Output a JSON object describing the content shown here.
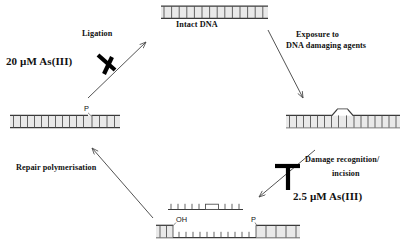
{
  "diagram": {
    "type": "cycle-diagram",
    "background_color": "#ffffff",
    "stroke_color": "#3a3a3a",
    "text_color": "#111111",
    "inhibitor_color": "#000000"
  },
  "nodes": [
    {
      "id": "intact-dna",
      "label": "Intact DNA",
      "position": "top",
      "state": "duplex-intact",
      "description": "continuous double-stranded DNA ladder, no lesion, no nick"
    },
    {
      "id": "damaged-dna",
      "label": "",
      "position": "right",
      "state": "duplex-lesion",
      "description": "double-stranded DNA with a distorting lesion bubble in the middle"
    },
    {
      "id": "incised-dna",
      "label": "",
      "position": "bottom",
      "state": "gapped-excised",
      "description": "excised oligonucleotide fragment containing the lesion released above a gapped duplex",
      "terminals": [
        {
          "id": "oh-terminus",
          "label": "OH",
          "side": "left"
        },
        {
          "id": "p-terminus",
          "label": "P",
          "side": "right"
        }
      ]
    },
    {
      "id": "repaired-nicked-dna",
      "label": "",
      "position": "left",
      "state": "duplex-nicked",
      "description": "resynthesised duplex still carrying a single-strand nick",
      "terminals": [
        {
          "id": "p-nick",
          "label": "P",
          "side": "right"
        }
      ]
    }
  ],
  "steps": [
    {
      "id": "step-exposure",
      "label_lines": [
        "Exposure to",
        "DNA damaging agents"
      ],
      "from": "intact-dna",
      "to": "damaged-dna",
      "inhibited": false,
      "inhibitor": null
    },
    {
      "id": "step-incision",
      "label_lines": [
        "Damage recognition/",
        "incision"
      ],
      "from": "damaged-dna",
      "to": "incised-dna",
      "inhibited": true,
      "inhibitor": "2.5 µM As(III)"
    },
    {
      "id": "step-polymerisation",
      "label_lines": [
        "Repair polymerisation"
      ],
      "from": "incised-dna",
      "to": "repaired-nicked-dna",
      "inhibited": false,
      "inhibitor": null
    },
    {
      "id": "step-ligation",
      "label_lines": [
        "Ligation"
      ],
      "from": "repaired-nicked-dna",
      "to": "intact-dna",
      "inhibited": true,
      "inhibitor": "20 µM As(III)"
    }
  ],
  "labels": {
    "intact_dna": "Intact DNA",
    "exposure_line1": "Exposure to",
    "exposure_line2": "DNA damaging agents",
    "damage_recognition_line1": "Damage recognition/",
    "damage_recognition_line2": "incision",
    "repair_polymerisation": "Repair polymerisation",
    "ligation": "Ligation",
    "conc_high": "20 µM As(III)",
    "conc_low": "2.5 µM As(III)",
    "oh_terminus": "OH",
    "p_terminus_bottom": "P",
    "p_terminus_left": "P"
  }
}
